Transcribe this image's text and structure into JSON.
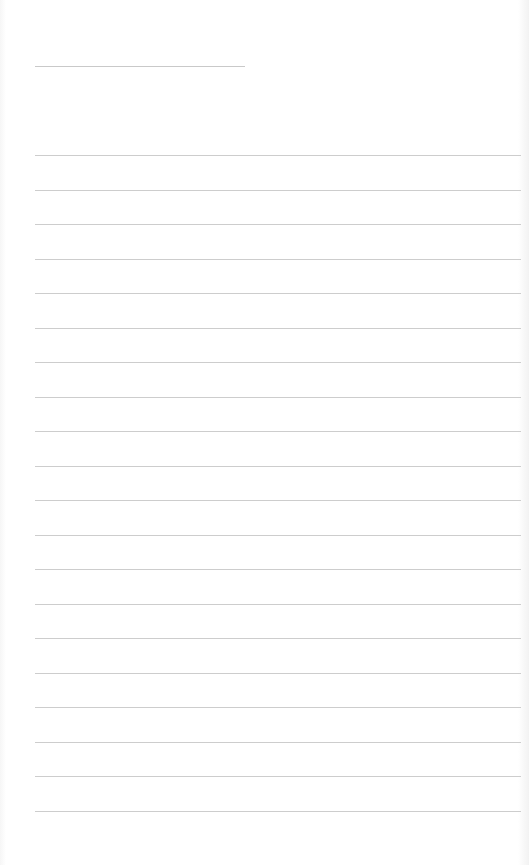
{
  "document": {
    "type": "lined-notepad",
    "header": {
      "text": ""
    },
    "lines": [
      {
        "text": ""
      },
      {
        "text": ""
      },
      {
        "text": ""
      },
      {
        "text": ""
      },
      {
        "text": ""
      },
      {
        "text": ""
      },
      {
        "text": ""
      },
      {
        "text": ""
      },
      {
        "text": ""
      },
      {
        "text": ""
      },
      {
        "text": ""
      },
      {
        "text": ""
      },
      {
        "text": ""
      },
      {
        "text": ""
      },
      {
        "text": ""
      },
      {
        "text": ""
      },
      {
        "text": ""
      },
      {
        "text": ""
      },
      {
        "text": ""
      },
      {
        "text": ""
      }
    ],
    "colors": {
      "rule": "#cdcdcd",
      "paper": "#ffffff"
    }
  }
}
